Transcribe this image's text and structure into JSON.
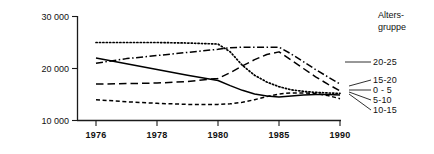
{
  "chart_data": {
    "type": "line",
    "title": "",
    "xlabel": "",
    "ylabel": "",
    "legend_title_line1": "Alters-",
    "legend_title_line2": "gruppe",
    "legend_position": "right",
    "grid": false,
    "x": [
      1976,
      1978,
      1980,
      1985,
      1990
    ],
    "xtick_labels": [
      "1976",
      "1978",
      "1980",
      "1985",
      "1990"
    ],
    "ytick_labels": [
      "10 000",
      "20 000",
      "30 000"
    ],
    "ytick_values": [
      10000,
      20000,
      30000
    ],
    "ylim": [
      10000,
      30000
    ],
    "series": [
      {
        "name": "20-25",
        "style": "dash-dot",
        "x": [
          1976,
          1977,
          1978,
          1979,
          1980,
          1981,
          1982,
          1983,
          1984,
          1985,
          1986,
          1987,
          1988,
          1989,
          1990
        ],
        "values": [
          21000,
          21900,
          22500,
          23100,
          23700,
          24000,
          24100,
          24100,
          24100,
          24100,
          22800,
          21300,
          19800,
          18400,
          17000
        ]
      },
      {
        "name": "15-20",
        "style": "dotted",
        "x": [
          1976,
          1977,
          1978,
          1979,
          1980,
          1981,
          1982,
          1983,
          1984,
          1985,
          1986,
          1987,
          1988,
          1989,
          1990
        ],
        "values": [
          25000,
          25000,
          25000,
          24900,
          24700,
          23200,
          20600,
          18700,
          17400,
          16500,
          15900,
          15600,
          15400,
          15300,
          15200
        ]
      },
      {
        "name": "0 - 5",
        "style": "long-dash",
        "x": [
          1976,
          1977,
          1978,
          1979,
          1980,
          1981,
          1982,
          1983,
          1984,
          1985,
          1986,
          1987,
          1988,
          1989,
          1990
        ],
        "values": [
          17000,
          17100,
          17200,
          17500,
          18100,
          19200,
          20500,
          21700,
          22700,
          23200,
          21600,
          20000,
          18400,
          17000,
          15700
        ]
      },
      {
        "name": "5-10",
        "style": "solid",
        "x": [
          1976,
          1977,
          1978,
          1979,
          1980,
          1981,
          1982,
          1983,
          1984,
          1985,
          1986,
          1987,
          1988,
          1989,
          1990
        ],
        "values": [
          22000,
          20900,
          19800,
          18700,
          17700,
          16700,
          15800,
          15100,
          14700,
          14500,
          14700,
          14900,
          15000,
          15000,
          14900
        ]
      },
      {
        "name": "10-15",
        "style": "short-dash",
        "x": [
          1976,
          1977,
          1978,
          1979,
          1980,
          1981,
          1982,
          1983,
          1984,
          1985,
          1986,
          1987,
          1988,
          1989,
          1990
        ],
        "values": [
          14000,
          13600,
          13300,
          13100,
          13100,
          13200,
          13500,
          14000,
          14600,
          15100,
          15300,
          15300,
          15200,
          14800,
          14200
        ]
      }
    ],
    "legend_entries": [
      {
        "label": "20-25",
        "style": "dash-dot"
      },
      {
        "label": "15-20",
        "style": "dotted"
      },
      {
        "label": "0 - 5",
        "style": "long-dash"
      },
      {
        "label": "5-10",
        "style": "solid"
      },
      {
        "label": "10-15",
        "style": "short-dash"
      }
    ]
  }
}
